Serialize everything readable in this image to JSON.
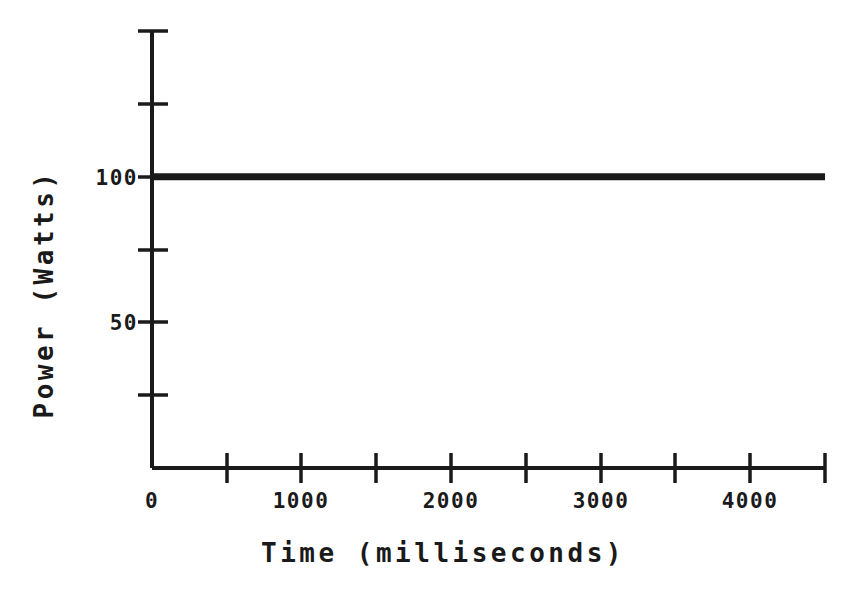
{
  "chart_data": {
    "type": "line",
    "title": "",
    "subtitle": "",
    "xlabel": "Time (milliseconds)",
    "ylabel": "Power (Watts)",
    "xlim": [
      0,
      4500
    ],
    "ylim": [
      0,
      150
    ],
    "grid": false,
    "legend": false,
    "x_ticks": [
      0,
      500,
      1000,
      1500,
      2000,
      2500,
      3000,
      3500,
      4000,
      4500
    ],
    "x_tick_labels": [
      {
        "value": 0,
        "text": "0"
      },
      {
        "value": 1000,
        "text": "1000"
      },
      {
        "value": 2000,
        "text": "2000"
      },
      {
        "value": 3000,
        "text": "3000"
      },
      {
        "value": 4000,
        "text": "4000"
      }
    ],
    "y_ticks": [
      0,
      25,
      50,
      75,
      100,
      125,
      150
    ],
    "y_tick_labels": [
      {
        "value": 50,
        "text": "50"
      },
      {
        "value": 100,
        "text": "100"
      }
    ],
    "series": [
      {
        "name": "Power",
        "color": "#1a1a1a",
        "x": [
          0,
          500,
          1000,
          1500,
          2000,
          2500,
          3000,
          3500,
          4000,
          4500
        ],
        "values": [
          100,
          100,
          100,
          100,
          100,
          100,
          100,
          100,
          100,
          100
        ]
      }
    ]
  },
  "axes": {
    "x_axis_label": "Time (milliseconds)",
    "y_axis_label": "Power (Watts)",
    "x_tick_text": [
      "0",
      "1000",
      "2000",
      "3000",
      "4000"
    ],
    "y_tick_text": [
      "100",
      "50"
    ]
  },
  "colors": {
    "ink": "#1a1a1a",
    "background": "#ffffff"
  }
}
